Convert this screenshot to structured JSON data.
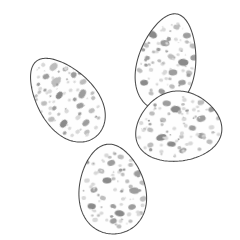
{
  "figure": {
    "title": "Four speckled birds' eggs",
    "style": "field-guide line illustration",
    "background_color": "#ffffff",
    "canvas": {
      "width": 240,
      "height": 240
    }
  },
  "palette": {
    "background": "#ffffff",
    "shell_fill": "#fefefe",
    "outline": "#4a4a4a",
    "speckle_light": "#d8d8d8",
    "speckle_mid": "#bdbdbd",
    "speckle_dark": "#9d9d9d",
    "speckle_darkest": "#8a8a8a"
  },
  "eggs": [
    {
      "id": "egg-upper-left",
      "label": "Upper left egg",
      "position": "upper-left",
      "center": {
        "x": 66,
        "y": 99
      },
      "radius": {
        "rx": 34,
        "ry": 48
      },
      "rotation_deg": -38,
      "pointed_end": "lower-left",
      "z_order": 1,
      "speckle_count": 78,
      "speckles": [
        {
          "cx": -2,
          "cy": -30,
          "rx": 3.4,
          "ry": 2.6,
          "rot": 15,
          "tone": "speckle_dark"
        },
        {
          "cx": 10,
          "cy": -33,
          "rx": 4.6,
          "ry": 3.2,
          "rot": -10,
          "tone": "speckle_mid"
        },
        {
          "cx": -14,
          "cy": -24,
          "rx": 2.1,
          "ry": 1.8,
          "rot": 0,
          "tone": "speckle_light"
        },
        {
          "cx": 18,
          "cy": -24,
          "rx": 2.8,
          "ry": 2.2,
          "rot": 20,
          "tone": "speckle_dark"
        },
        {
          "cx": 3,
          "cy": -20,
          "rx": 5.2,
          "ry": 3.6,
          "rot": 8,
          "tone": "speckle_mid"
        },
        {
          "cx": -8,
          "cy": -16,
          "rx": 2.3,
          "ry": 2.0,
          "rot": 0,
          "tone": "speckle_light"
        },
        {
          "cx": 21,
          "cy": -14,
          "rx": 3.1,
          "ry": 2.4,
          "rot": -25,
          "tone": "speckle_dark"
        },
        {
          "cx": 12,
          "cy": -12,
          "rx": 1.5,
          "ry": 1.3,
          "rot": 0,
          "tone": "speckle_light"
        },
        {
          "cx": -20,
          "cy": -10,
          "rx": 3.0,
          "ry": 2.3,
          "rot": 30,
          "tone": "speckle_mid"
        },
        {
          "cx": -3,
          "cy": -7,
          "rx": 4.2,
          "ry": 2.9,
          "rot": -15,
          "tone": "speckle_darkest"
        },
        {
          "cx": 9,
          "cy": -4,
          "rx": 2.0,
          "ry": 1.7,
          "rot": 0,
          "tone": "speckle_light"
        },
        {
          "cx": 24,
          "cy": -3,
          "rx": 3.6,
          "ry": 2.6,
          "rot": 10,
          "tone": "speckle_mid"
        },
        {
          "cx": -15,
          "cy": 0,
          "rx": 2.6,
          "ry": 2.1,
          "rot": 0,
          "tone": "speckle_dark"
        },
        {
          "cx": 2,
          "cy": 3,
          "rx": 1.6,
          "ry": 1.4,
          "rot": 0,
          "tone": "speckle_light"
        },
        {
          "cx": 16,
          "cy": 6,
          "rx": 4.8,
          "ry": 3.3,
          "rot": -20,
          "tone": "speckle_dark"
        },
        {
          "cx": -24,
          "cy": 7,
          "rx": 3.3,
          "ry": 2.5,
          "rot": 25,
          "tone": "speckle_mid"
        },
        {
          "cx": -7,
          "cy": 10,
          "rx": 2.4,
          "ry": 2.0,
          "rot": 0,
          "tone": "speckle_light"
        },
        {
          "cx": 7,
          "cy": 14,
          "rx": 3.8,
          "ry": 2.7,
          "rot": 15,
          "tone": "speckle_dark"
        },
        {
          "cx": 22,
          "cy": 16,
          "rx": 2.2,
          "ry": 1.9,
          "rot": 0,
          "tone": "speckle_mid"
        },
        {
          "cx": -17,
          "cy": 18,
          "rx": 4.4,
          "ry": 3.0,
          "rot": -12,
          "tone": "speckle_darkest"
        },
        {
          "cx": -2,
          "cy": 22,
          "rx": 2.7,
          "ry": 2.2,
          "rot": 0,
          "tone": "speckle_light"
        },
        {
          "cx": 13,
          "cy": 25,
          "rx": 3.2,
          "ry": 2.4,
          "rot": 18,
          "tone": "speckle_mid"
        },
        {
          "cx": -22,
          "cy": 26,
          "rx": 2.0,
          "ry": 1.7,
          "rot": 0,
          "tone": "speckle_dark"
        },
        {
          "cx": 1,
          "cy": 31,
          "rx": 4.0,
          "ry": 2.8,
          "rot": -8,
          "tone": "speckle_dark"
        },
        {
          "cx": -11,
          "cy": 33,
          "rx": 2.5,
          "ry": 2.0,
          "rot": 0,
          "tone": "speckle_light"
        },
        {
          "cx": 14,
          "cy": 35,
          "rx": 1.8,
          "ry": 1.5,
          "rot": 0,
          "tone": "speckle_mid"
        },
        {
          "cx": -4,
          "cy": 39,
          "rx": 3.0,
          "ry": 2.2,
          "rot": 12,
          "tone": "speckle_mid"
        },
        {
          "cx": 6,
          "cy": 41,
          "rx": 2.2,
          "ry": 1.8,
          "rot": 0,
          "tone": "speckle_light"
        }
      ]
    },
    {
      "id": "egg-upper-right",
      "label": "Upper right egg",
      "position": "upper-right",
      "center": {
        "x": 167,
        "y": 62
      },
      "radius": {
        "rx": 34,
        "ry": 49
      },
      "rotation_deg": 12,
      "pointed_end": "lower-left",
      "z_order": 2,
      "speckle_count": 82,
      "speckles": [
        {
          "cx": 2,
          "cy": -36,
          "rx": 3.2,
          "ry": 2.4,
          "rot": 10,
          "tone": "speckle_mid"
        },
        {
          "cx": -10,
          "cy": -31,
          "rx": 2.2,
          "ry": 1.9,
          "rot": 0,
          "tone": "speckle_light"
        },
        {
          "cx": 14,
          "cy": -30,
          "rx": 4.0,
          "ry": 2.8,
          "rot": -15,
          "tone": "speckle_dark"
        },
        {
          "cx": -20,
          "cy": -24,
          "rx": 5.0,
          "ry": 3.4,
          "rot": 20,
          "tone": "speckle_darkest"
        },
        {
          "cx": 4,
          "cy": -24,
          "rx": 2.0,
          "ry": 1.7,
          "rot": 0,
          "tone": "speckle_light"
        },
        {
          "cx": 22,
          "cy": -21,
          "rx": 3.4,
          "ry": 2.5,
          "rot": 8,
          "tone": "speckle_mid"
        },
        {
          "cx": -6,
          "cy": -18,
          "rx": 4.6,
          "ry": 3.1,
          "rot": -10,
          "tone": "speckle_dark"
        },
        {
          "cx": 11,
          "cy": -15,
          "rx": 2.4,
          "ry": 2.0,
          "rot": 0,
          "tone": "speckle_light"
        },
        {
          "cx": -24,
          "cy": -12,
          "rx": 3.0,
          "ry": 2.3,
          "rot": 25,
          "tone": "speckle_mid"
        },
        {
          "cx": 26,
          "cy": -10,
          "rx": 4.2,
          "ry": 2.9,
          "rot": -18,
          "tone": "speckle_dark"
        },
        {
          "cx": -12,
          "cy": -8,
          "rx": 1.8,
          "ry": 1.5,
          "rot": 0,
          "tone": "speckle_light"
        },
        {
          "cx": 3,
          "cy": -6,
          "rx": 3.6,
          "ry": 2.6,
          "rot": 12,
          "tone": "speckle_mid"
        },
        {
          "cx": 16,
          "cy": -3,
          "rx": 5.2,
          "ry": 3.5,
          "rot": -8,
          "tone": "speckle_darkest"
        },
        {
          "cx": -20,
          "cy": 0,
          "rx": 2.6,
          "ry": 2.1,
          "rot": 0,
          "tone": "speckle_dark"
        },
        {
          "cx": -4,
          "cy": 3,
          "rx": 2.0,
          "ry": 1.7,
          "rot": 0,
          "tone": "speckle_light"
        },
        {
          "cx": 24,
          "cy": 6,
          "rx": 3.2,
          "ry": 2.4,
          "rot": 15,
          "tone": "speckle_mid"
        },
        {
          "cx": 8,
          "cy": 9,
          "rx": 4.4,
          "ry": 3.0,
          "rot": -12,
          "tone": "speckle_dark"
        },
        {
          "cx": -14,
          "cy": 11,
          "rx": 2.3,
          "ry": 1.9,
          "rot": 0,
          "tone": "speckle_light"
        },
        {
          "cx": -25,
          "cy": 14,
          "rx": 3.0,
          "ry": 2.2,
          "rot": 20,
          "tone": "speckle_mid"
        },
        {
          "cx": 19,
          "cy": 17,
          "rx": 3.8,
          "ry": 2.7,
          "rot": -20,
          "tone": "speckle_dark"
        },
        {
          "cx": -2,
          "cy": 19,
          "rx": 2.1,
          "ry": 1.8,
          "rot": 0,
          "tone": "speckle_light"
        },
        {
          "cx": 10,
          "cy": 23,
          "rx": 2.8,
          "ry": 2.2,
          "rot": 10,
          "tone": "speckle_mid"
        },
        {
          "cx": -18,
          "cy": 25,
          "rx": 4.0,
          "ry": 2.8,
          "rot": -15,
          "tone": "speckle_darkest"
        },
        {
          "cx": 23,
          "cy": 28,
          "rx": 2.4,
          "ry": 2.0,
          "rot": 0,
          "tone": "speckle_light"
        },
        {
          "cx": 1,
          "cy": 30,
          "rx": 3.4,
          "ry": 2.5,
          "rot": 18,
          "tone": "speckle_dark"
        },
        {
          "cx": -9,
          "cy": 34,
          "rx": 2.6,
          "ry": 2.1,
          "rot": 0,
          "tone": "speckle_mid"
        },
        {
          "cx": 14,
          "cy": 36,
          "rx": 3.0,
          "ry": 2.3,
          "rot": -10,
          "tone": "speckle_mid"
        },
        {
          "cx": -2,
          "cy": 40,
          "rx": 2.0,
          "ry": 1.7,
          "rot": 0,
          "tone": "speckle_light"
        }
      ]
    },
    {
      "id": "egg-middle-right",
      "label": "Middle right egg",
      "position": "middle-right",
      "center": {
        "x": 178,
        "y": 126
      },
      "radius": {
        "rx": 50,
        "ry": 35
      },
      "rotation_deg": -8,
      "pointed_end": "left",
      "z_order": 4,
      "speckle_count": 86,
      "speckles": [
        {
          "cx": -8,
          "cy": -24,
          "rx": 4.2,
          "ry": 2.9,
          "rot": 10,
          "tone": "speckle_dark"
        },
        {
          "cx": 10,
          "cy": -25,
          "rx": 2.4,
          "ry": 2.0,
          "rot": 0,
          "tone": "speckle_light"
        },
        {
          "cx": 26,
          "cy": -20,
          "rx": 3.4,
          "ry": 2.5,
          "rot": -12,
          "tone": "speckle_mid"
        },
        {
          "cx": -24,
          "cy": -16,
          "rx": 2.8,
          "ry": 2.2,
          "rot": 20,
          "tone": "speckle_mid"
        },
        {
          "cx": 0,
          "cy": -17,
          "rx": 5.0,
          "ry": 3.4,
          "rot": 8,
          "tone": "speckle_darkest"
        },
        {
          "cx": 18,
          "cy": -14,
          "rx": 2.0,
          "ry": 1.7,
          "rot": 0,
          "tone": "speckle_light"
        },
        {
          "cx": 36,
          "cy": -12,
          "rx": 3.8,
          "ry": 2.7,
          "rot": -18,
          "tone": "speckle_dark"
        },
        {
          "cx": -36,
          "cy": -8,
          "rx": 2.2,
          "ry": 1.9,
          "rot": 0,
          "tone": "speckle_light"
        },
        {
          "cx": -14,
          "cy": -8,
          "rx": 3.2,
          "ry": 2.4,
          "rot": 15,
          "tone": "speckle_mid"
        },
        {
          "cx": 7,
          "cy": -6,
          "rx": 2.6,
          "ry": 2.1,
          "rot": 0,
          "tone": "speckle_light"
        },
        {
          "cx": 24,
          "cy": -4,
          "rx": 4.6,
          "ry": 3.1,
          "rot": -10,
          "tone": "speckle_dark"
        },
        {
          "cx": 41,
          "cy": -2,
          "rx": 2.4,
          "ry": 2.0,
          "rot": 0,
          "tone": "speckle_mid"
        },
        {
          "cx": -28,
          "cy": 0,
          "rx": 3.0,
          "ry": 2.3,
          "rot": 25,
          "tone": "speckle_mid"
        },
        {
          "cx": -4,
          "cy": 2,
          "rx": 2.0,
          "ry": 1.7,
          "rot": 0,
          "tone": "speckle_light"
        },
        {
          "cx": 14,
          "cy": 4,
          "rx": 3.6,
          "ry": 2.6,
          "rot": 12,
          "tone": "speckle_dark"
        },
        {
          "cx": 33,
          "cy": 6,
          "rx": 2.8,
          "ry": 2.2,
          "rot": 0,
          "tone": "speckle_light"
        },
        {
          "cx": -40,
          "cy": 6,
          "rx": 2.1,
          "ry": 1.8,
          "rot": 0,
          "tone": "speckle_light"
        },
        {
          "cx": -18,
          "cy": 9,
          "rx": 5.4,
          "ry": 3.2,
          "rot": -8,
          "tone": "speckle_darkest"
        },
        {
          "cx": 2,
          "cy": 11,
          "rx": 2.3,
          "ry": 1.9,
          "rot": 0,
          "tone": "speckle_mid"
        },
        {
          "cx": 22,
          "cy": 13,
          "rx": 4.0,
          "ry": 2.8,
          "rot": 18,
          "tone": "speckle_dark"
        },
        {
          "cx": 39,
          "cy": 14,
          "rx": 2.0,
          "ry": 1.7,
          "rot": 0,
          "tone": "speckle_light"
        },
        {
          "cx": -30,
          "cy": 15,
          "rx": 3.2,
          "ry": 2.4,
          "rot": -20,
          "tone": "speckle_mid"
        },
        {
          "cx": -9,
          "cy": 17,
          "rx": 4.4,
          "ry": 2.6,
          "rot": 10,
          "tone": "speckle_darkest"
        },
        {
          "cx": 10,
          "cy": 19,
          "rx": 2.5,
          "ry": 2.0,
          "rot": 0,
          "tone": "speckle_light"
        },
        {
          "cx": 29,
          "cy": 20,
          "rx": 3.0,
          "ry": 2.3,
          "rot": 15,
          "tone": "speckle_mid"
        },
        {
          "cx": -20,
          "cy": 23,
          "rx": 2.2,
          "ry": 1.8,
          "rot": 0,
          "tone": "speckle_light"
        },
        {
          "cx": 1,
          "cy": 25,
          "rx": 3.4,
          "ry": 2.4,
          "rot": -12,
          "tone": "speckle_dark"
        },
        {
          "cx": 18,
          "cy": 26,
          "rx": 2.0,
          "ry": 1.7,
          "rot": 0,
          "tone": "speckle_mid"
        }
      ]
    },
    {
      "id": "egg-bottom",
      "label": "Bottom egg",
      "position": "bottom-center",
      "center": {
        "x": 112,
        "y": 189
      },
      "radius": {
        "rx": 39,
        "ry": 45
      },
      "rotation_deg": -6,
      "pointed_end": "top",
      "z_order": 3,
      "speckle_count": 84,
      "speckles": [
        {
          "cx": -2,
          "cy": -34,
          "rx": 2.4,
          "ry": 2.0,
          "rot": 0,
          "tone": "speckle_light"
        },
        {
          "cx": 12,
          "cy": -31,
          "rx": 3.2,
          "ry": 2.4,
          "rot": 12,
          "tone": "speckle_mid"
        },
        {
          "cx": -16,
          "cy": -27,
          "rx": 2.0,
          "ry": 1.7,
          "rot": 0,
          "tone": "speckle_light"
        },
        {
          "cx": 2,
          "cy": -26,
          "rx": 4.0,
          "ry": 2.8,
          "rot": -10,
          "tone": "speckle_dark"
        },
        {
          "cx": 21,
          "cy": -22,
          "rx": 2.6,
          "ry": 2.1,
          "rot": 0,
          "tone": "speckle_mid"
        },
        {
          "cx": -9,
          "cy": -19,
          "rx": 3.4,
          "ry": 2.5,
          "rot": 20,
          "tone": "speckle_mid"
        },
        {
          "cx": 9,
          "cy": -16,
          "rx": 2.1,
          "ry": 1.8,
          "rot": 0,
          "tone": "speckle_light"
        },
        {
          "cx": 27,
          "cy": -13,
          "rx": 3.8,
          "ry": 2.7,
          "rot": -15,
          "tone": "speckle_dark"
        },
        {
          "cx": -24,
          "cy": -11,
          "rx": 2.8,
          "ry": 2.2,
          "rot": 0,
          "tone": "speckle_light"
        },
        {
          "cx": -4,
          "cy": -9,
          "rx": 4.6,
          "ry": 3.0,
          "rot": 10,
          "tone": "speckle_darkest"
        },
        {
          "cx": 16,
          "cy": -6,
          "rx": 2.2,
          "ry": 1.9,
          "rot": 0,
          "tone": "speckle_mid"
        },
        {
          "cx": 31,
          "cy": -3,
          "rx": 3.0,
          "ry": 2.3,
          "rot": 18,
          "tone": "speckle_mid"
        },
        {
          "cx": -18,
          "cy": -1,
          "rx": 3.6,
          "ry": 2.6,
          "rot": -12,
          "tone": "speckle_dark"
        },
        {
          "cx": 3,
          "cy": 1,
          "rx": 2.0,
          "ry": 1.7,
          "rot": 0,
          "tone": "speckle_light"
        },
        {
          "cx": 22,
          "cy": 4,
          "rx": 4.8,
          "ry": 3.2,
          "rot": 8,
          "tone": "speckle_dark"
        },
        {
          "cx": -29,
          "cy": 6,
          "rx": 2.4,
          "ry": 2.0,
          "rot": 0,
          "tone": "speckle_light"
        },
        {
          "cx": -10,
          "cy": 8,
          "rx": 3.0,
          "ry": 2.3,
          "rot": 25,
          "tone": "speckle_mid"
        },
        {
          "cx": 10,
          "cy": 11,
          "rx": 2.2,
          "ry": 1.8,
          "rot": 0,
          "tone": "speckle_light"
        },
        {
          "cx": 30,
          "cy": 13,
          "rx": 3.4,
          "ry": 2.5,
          "rot": -18,
          "tone": "speckle_mid"
        },
        {
          "cx": -22,
          "cy": 15,
          "rx": 4.2,
          "ry": 2.9,
          "rot": 12,
          "tone": "speckle_darkest"
        },
        {
          "cx": -1,
          "cy": 17,
          "rx": 2.6,
          "ry": 2.1,
          "rot": 0,
          "tone": "speckle_dark"
        },
        {
          "cx": 18,
          "cy": 20,
          "rx": 3.8,
          "ry": 2.7,
          "rot": -10,
          "tone": "speckle_dark"
        },
        {
          "cx": -13,
          "cy": 23,
          "rx": 2.0,
          "ry": 1.7,
          "rot": 0,
          "tone": "speckle_light"
        },
        {
          "cx": 5,
          "cy": 25,
          "rx": 5.0,
          "ry": 3.0,
          "rot": 15,
          "tone": "speckle_darkest"
        },
        {
          "cx": 26,
          "cy": 27,
          "rx": 2.4,
          "ry": 2.0,
          "rot": 0,
          "tone": "speckle_mid"
        },
        {
          "cx": -20,
          "cy": 29,
          "rx": 2.8,
          "ry": 2.2,
          "rot": 0,
          "tone": "speckle_light"
        },
        {
          "cx": -2,
          "cy": 32,
          "rx": 3.6,
          "ry": 2.5,
          "rot": -14,
          "tone": "speckle_dark"
        },
        {
          "cx": 15,
          "cy": 34,
          "rx": 2.2,
          "ry": 1.8,
          "rot": 0,
          "tone": "speckle_mid"
        },
        {
          "cx": 3,
          "cy": 38,
          "rx": 2.6,
          "ry": 2.0,
          "rot": 10,
          "tone": "speckle_mid"
        }
      ]
    }
  ]
}
